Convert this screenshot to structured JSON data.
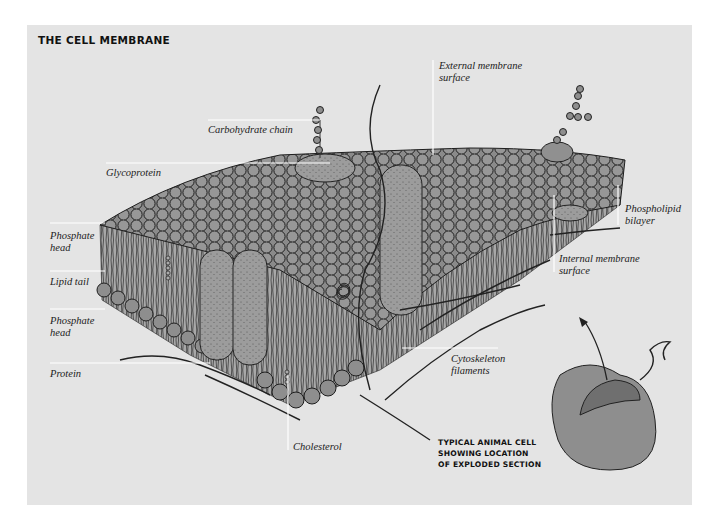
{
  "figure": {
    "title": "THE CELL MEMBRANE",
    "background_color": "#e4e4e4",
    "ink_color": "#1a1a1a",
    "sphere_color": "#8c8c8c",
    "protein_color": "#9a9a9a",
    "leader_line_color": "#ffffff"
  },
  "labels": {
    "carbohydrate_chain": "Carbohydrate chain",
    "glycoprotein": "Glycoprotein",
    "external_surface": "External membrane\nsurface",
    "phosphate_head_top": "Phosphate\nhead",
    "lipid_tail": "Lipid tail",
    "phosphate_head_bottom": "Phosphate\nhead",
    "protein": "Protein",
    "phospholipid_bilayer": "Phospholipid\nbilayer",
    "internal_surface": "Internal membrane\nsurface",
    "cytoskeleton": "Cytoskeleton\nfilaments",
    "cholesterol": "Cholesterol"
  },
  "inset": {
    "caption": "TYPICAL ANIMAL CELL\nSHOWING LOCATION\nOF EXPLODED SECTION"
  }
}
